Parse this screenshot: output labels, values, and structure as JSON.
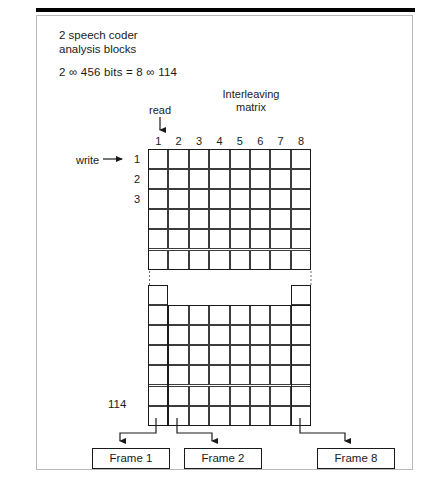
{
  "figure": {
    "caption_top": "2 speech coder\nanalysis blocks",
    "equation": "2 ∞ 456 bits = 8 ∞ 114",
    "matrix_title": "Interleaving\nmatrix",
    "read_label": "read",
    "write_label": "write",
    "last_row_label": "114"
  },
  "grid": {
    "column_headers": [
      "1",
      "2",
      "3",
      "4",
      "5",
      "6",
      "7",
      "8"
    ],
    "row_labels_top": [
      "1",
      "2",
      "3"
    ],
    "top_rows": 6,
    "top_cols": 8,
    "bottom_rows": 7,
    "bottom_cols": 8,
    "bottom_notch_rows": 1,
    "bottom_notch_start_col": 2,
    "bottom_notch_end_col": 7
  },
  "frames": [
    {
      "label": "Frame 1"
    },
    {
      "label": "Frame 2"
    },
    {
      "label": "Frame 8"
    }
  ],
  "colors": {
    "ink": "#1a1a1a",
    "grid_line": "#3c3c3c",
    "border": "#b8b8b8",
    "background": "#ffffff"
  }
}
